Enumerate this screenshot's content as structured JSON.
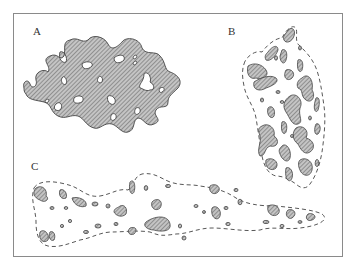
{
  "figure": {
    "panels": [
      {
        "id": "A",
        "label": "A",
        "description": "Continuous hatched region with scattered unhatched holes"
      },
      {
        "id": "B",
        "label": "B",
        "description": "Dashed outline enclosing many irregular hatched patches (dense)"
      },
      {
        "id": "C",
        "label": "C",
        "description": "Elongated dashed outline enclosing sparse small hatched patches"
      }
    ]
  },
  "colors": {
    "frame": "#8a8a8a",
    "hatch_fill": "#bdbdbd",
    "hatch_line": "#555555",
    "outline": "#444444",
    "background": "#ffffff"
  }
}
